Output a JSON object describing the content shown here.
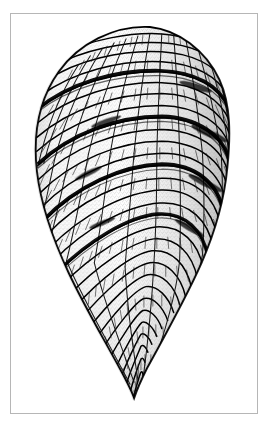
{
  "figure": {
    "kind": "scientific-illustration",
    "technique": "pen-and-ink stipple engraving",
    "orientation": "apical end up, aperture tip down",
    "background_color": "#ffffff",
    "ink_color": "#000000",
    "stipple_color": "#4a4a4a",
    "frame": {
      "border_color": "#b6b6b6",
      "border_width_px": 1,
      "x": 10,
      "y": 13,
      "width": 248,
      "height": 401
    },
    "silhouette": {
      "apex_x": 150,
      "apex_y": 26,
      "widest_y": 170,
      "left_extent_x": 28,
      "right_extent_x": 228,
      "tip_x": 131,
      "tip_y": 399,
      "max_width_px": 200,
      "total_height_px": 373
    },
    "structure": {
      "whorl_count": 5,
      "suture_count": 4,
      "rib_row_count": 46,
      "segments_per_row_max": 26,
      "description": "Conical shell built of tightly packed rectangular chamber segments arranged in spiraling transverse rows, separated by heavy dark suture bands; rows converge to a narrow rounded tip at the base."
    },
    "sutures": [
      {
        "label": "suture-1",
        "left_y": 96,
        "right_y": 118
      },
      {
        "label": "suture-2",
        "left_y": 152,
        "right_y": 178
      },
      {
        "label": "suture-3",
        "left_y": 208,
        "right_y": 232
      },
      {
        "label": "suture-4",
        "left_y": 258,
        "right_y": 276
      }
    ],
    "shading": {
      "highlight_side": "left-center",
      "shadow_side": "right",
      "shadow_opacity": 0.3
    }
  }
}
